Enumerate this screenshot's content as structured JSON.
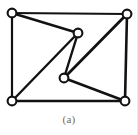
{
  "figure": {
    "caption": "(a)",
    "type": "undirected-graph-diagram",
    "background_color": "#ffffff",
    "ink_color": "#121212",
    "caption_color": "#6b6b6b",
    "node_fill_color": "#ffffff",
    "canvas": {
      "width": 138,
      "height": 135
    },
    "nodes": [
      {
        "id": "top-left",
        "label": "",
        "x": 12,
        "y": 13,
        "r": 4.4
      },
      {
        "id": "top-right",
        "label": "",
        "x": 127,
        "y": 14,
        "r": 4.4
      },
      {
        "id": "upper-middle",
        "label": "",
        "x": 78,
        "y": 33,
        "r": 4.4
      },
      {
        "id": "lower-middle",
        "label": "",
        "x": 64,
        "y": 78,
        "r": 4.4
      },
      {
        "id": "bottom-left",
        "label": "",
        "x": 12,
        "y": 101,
        "r": 4.4
      },
      {
        "id": "bottom-right",
        "label": "",
        "x": 125,
        "y": 101,
        "r": 4.4
      }
    ],
    "edges": [
      {
        "id": "edge-tl-tr",
        "from": "top-left",
        "to": "top-right",
        "width": 2.2
      },
      {
        "id": "edge-tl-bl",
        "from": "top-left",
        "to": "bottom-left",
        "width": 2.2
      },
      {
        "id": "edge-tr-br",
        "from": "top-right",
        "to": "bottom-right",
        "width": 2.6
      },
      {
        "id": "edge-bl-br",
        "from": "bottom-left",
        "to": "bottom-right",
        "width": 2.6
      },
      {
        "id": "edge-tl-um",
        "from": "top-left",
        "to": "upper-middle",
        "width": 2.4
      },
      {
        "id": "edge-um-bl",
        "from": "upper-middle",
        "to": "bottom-left",
        "width": 2.4
      },
      {
        "id": "edge-um-lm",
        "from": "upper-middle",
        "to": "lower-middle",
        "width": 2.4
      },
      {
        "id": "edge-lm-tr",
        "from": "lower-middle",
        "to": "top-right",
        "width": 2.8
      },
      {
        "id": "edge-lm-br",
        "from": "lower-middle",
        "to": "bottom-right",
        "width": 2.6
      }
    ],
    "counts": {
      "nodes": 6,
      "edges": 9
    }
  }
}
